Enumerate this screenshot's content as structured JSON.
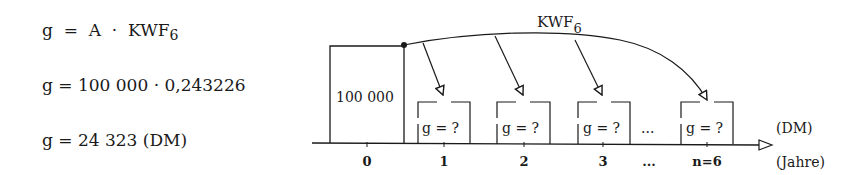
{
  "formulas": {
    "line1": {
      "lhs": "g",
      "eq": "=",
      "A": "A",
      "dot": "·",
      "factor": "KWF",
      "sub": "6"
    },
    "line2": "g = 100 000 · 0,243226",
    "line3": "g = 24 323 (DM)"
  },
  "diagram": {
    "arc_label": "KWF",
    "arc_label_sub": "6",
    "principal": "100 000",
    "payment_label": "g = ?",
    "ellipsis": "...",
    "unit_right": "(DM)",
    "axis_label": "(Jahre)",
    "ticks": [
      "0",
      "1",
      "2",
      "3",
      "...",
      "n=6"
    ]
  }
}
